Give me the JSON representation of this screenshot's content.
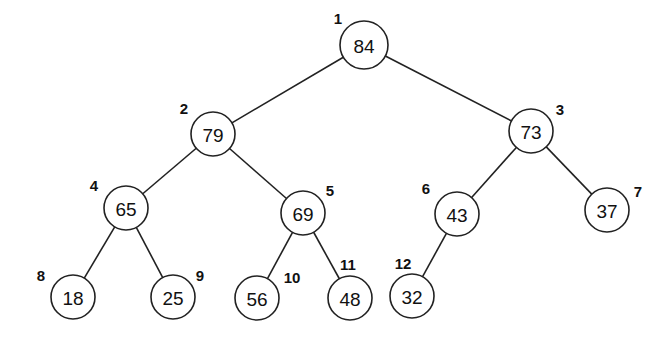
{
  "diagram": {
    "type": "binary-heap-tree",
    "nodes": [
      {
        "index": "1",
        "value": "84",
        "cx": 364,
        "cy": 45,
        "r": 24,
        "lx": 338,
        "ly": 18
      },
      {
        "index": "2",
        "value": "79",
        "cx": 213,
        "cy": 134,
        "r": 22,
        "lx": 184,
        "ly": 108
      },
      {
        "index": "3",
        "value": "73",
        "cx": 531,
        "cy": 131,
        "r": 22,
        "lx": 560,
        "ly": 109
      },
      {
        "index": "4",
        "value": "65",
        "cx": 126,
        "cy": 208,
        "r": 22,
        "lx": 94,
        "ly": 185
      },
      {
        "index": "5",
        "value": "69",
        "cx": 303,
        "cy": 213,
        "r": 22,
        "lx": 330,
        "ly": 190
      },
      {
        "index": "6",
        "value": "43",
        "cx": 457,
        "cy": 214,
        "r": 22,
        "lx": 426,
        "ly": 188
      },
      {
        "index": "7",
        "value": "37",
        "cx": 607,
        "cy": 210,
        "r": 22,
        "lx": 638,
        "ly": 191
      },
      {
        "index": "8",
        "value": "18",
        "cx": 73,
        "cy": 297,
        "r": 22,
        "lx": 41,
        "ly": 275
      },
      {
        "index": "9",
        "value": "25",
        "cx": 173,
        "cy": 297,
        "r": 22,
        "lx": 200,
        "ly": 275
      },
      {
        "index": "10",
        "value": "56",
        "cx": 257,
        "cy": 298,
        "r": 22,
        "lx": 292,
        "ly": 277
      },
      {
        "index": "11",
        "value": "48",
        "cx": 350,
        "cy": 298,
        "r": 22,
        "lx": 348,
        "ly": 264
      },
      {
        "index": "12",
        "value": "32",
        "cx": 412,
        "cy": 296,
        "r": 22,
        "lx": 403,
        "ly": 263
      }
    ],
    "edges": [
      [
        "1",
        "2"
      ],
      [
        "1",
        "3"
      ],
      [
        "2",
        "4"
      ],
      [
        "2",
        "5"
      ],
      [
        "3",
        "6"
      ],
      [
        "3",
        "7"
      ],
      [
        "4",
        "8"
      ],
      [
        "4",
        "9"
      ],
      [
        "5",
        "10"
      ],
      [
        "5",
        "11"
      ],
      [
        "6",
        "12"
      ]
    ]
  }
}
